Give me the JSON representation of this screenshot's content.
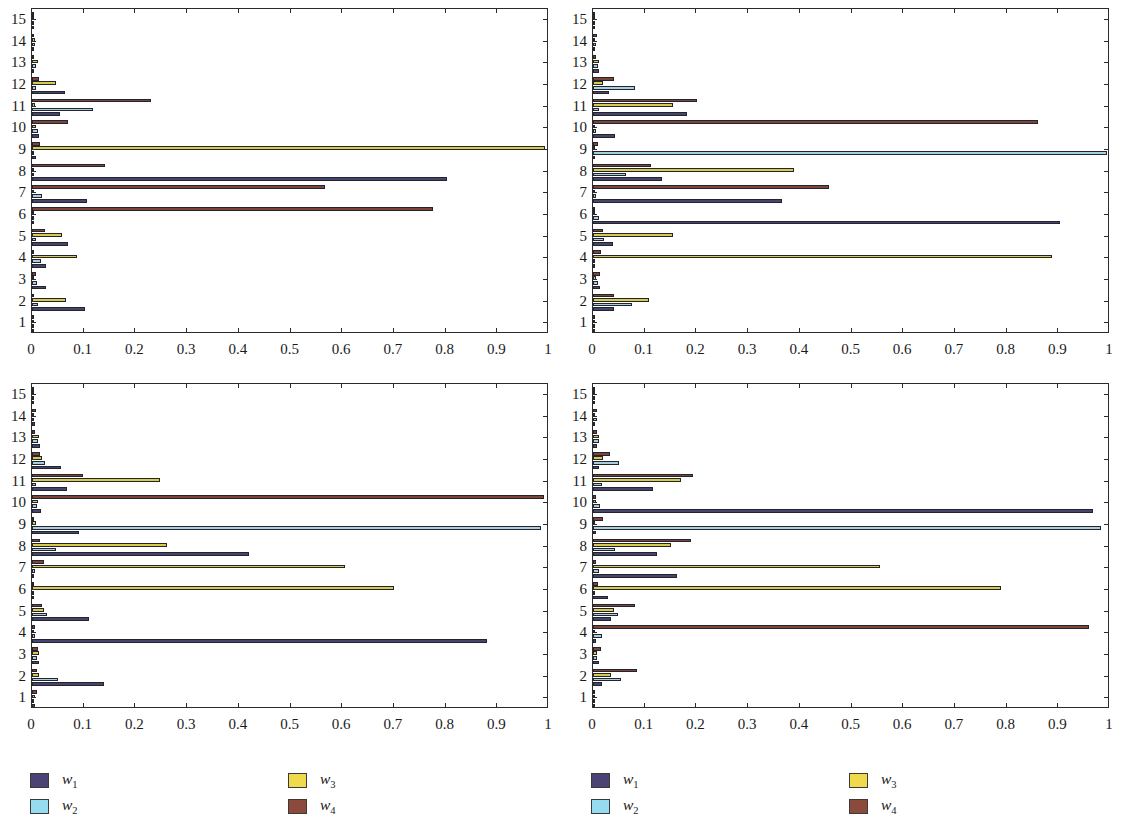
{
  "figure": {
    "width": 1122,
    "height": 825,
    "background": "#ffffff"
  },
  "series_colors": {
    "w1": "#45456e",
    "w2": "#a8cfe0",
    "w3": "#d8cb49",
    "w4": "#7d4438"
  },
  "legend_colors": {
    "w1": "#4a4373",
    "w2": "#96dcf0",
    "w3": "#f0d94a",
    "w4": "#8c4a3c"
  },
  "legends": [
    {
      "name": "legend-left",
      "items": [
        {
          "key": "w1",
          "label": "w",
          "sub": "1"
        },
        {
          "key": "w2",
          "label": "w",
          "sub": "2"
        },
        {
          "key": "w3",
          "label": "w",
          "sub": "3"
        },
        {
          "key": "w4",
          "label": "w",
          "sub": "4"
        }
      ]
    },
    {
      "name": "legend-right",
      "items": [
        {
          "key": "w1",
          "label": "w",
          "sub": "1"
        },
        {
          "key": "w2",
          "label": "w",
          "sub": "2"
        },
        {
          "key": "w3",
          "label": "w",
          "sub": "3"
        },
        {
          "key": "w4",
          "label": "w",
          "sub": "4"
        }
      ]
    }
  ],
  "axis": {
    "x_ticks": [
      "0",
      "0.1",
      "0.2",
      "0.3",
      "0.4",
      "0.5",
      "0.6",
      "0.7",
      "0.8",
      "0.9",
      "1"
    ],
    "x_tick_values": [
      0,
      0.1,
      0.2,
      0.3,
      0.4,
      0.5,
      0.6,
      0.7,
      0.8,
      0.9,
      1
    ],
    "xlim": [
      0,
      1
    ],
    "y_ticks": [
      "1",
      "2",
      "3",
      "4",
      "5",
      "6",
      "7",
      "8",
      "9",
      "10",
      "11",
      "12",
      "13",
      "14",
      "15"
    ],
    "grid": false
  },
  "chart_data": [
    {
      "type": "bar",
      "orientation": "horizontal",
      "title": "Normal gait",
      "xlabel": "",
      "ylabel": "",
      "xlim": [
        0,
        1
      ],
      "categories": [
        "1",
        "2",
        "3",
        "4",
        "5",
        "6",
        "7",
        "8",
        "9",
        "10",
        "11",
        "12",
        "13",
        "14",
        "15"
      ],
      "legend_position": "below-figure",
      "series": [
        {
          "name": "w1",
          "values": [
            0.004,
            0.103,
            0.027,
            0.028,
            0.07,
            0.003,
            0.106,
            0.803,
            0.008,
            0.013,
            0.055,
            0.064,
            0.003,
            0.004,
            0.002
          ]
        },
        {
          "name": "w2",
          "values": [
            0.003,
            0.011,
            0.009,
            0.018,
            0.007,
            0.002,
            0.019,
            0.003,
            0.003,
            0.012,
            0.118,
            0.008,
            0.008,
            0.006,
            0.002
          ]
        },
        {
          "name": "w3",
          "values": [
            0.002,
            0.066,
            0.003,
            0.088,
            0.058,
            0.002,
            0.004,
            0.004,
            0.993,
            0.008,
            0.005,
            0.046,
            0.012,
            0.005,
            0.001
          ]
        },
        {
          "name": "w4",
          "values": [
            0.002,
            0.004,
            0.008,
            0.004,
            0.026,
            0.775,
            0.566,
            0.142,
            0.016,
            0.07,
            0.231,
            0.013,
            0.004,
            0.004,
            0.002
          ]
        }
      ]
    },
    {
      "type": "bar",
      "orientation": "horizontal",
      "title": "Bouncy gait",
      "xlabel": "",
      "ylabel": "",
      "xlim": [
        0,
        1
      ],
      "categories": [
        "1",
        "2",
        "3",
        "4",
        "5",
        "6",
        "7",
        "8",
        "9",
        "10",
        "11",
        "12",
        "13",
        "14",
        "15"
      ],
      "legend_position": "below-figure",
      "series": [
        {
          "name": "w1",
          "values": [
            0.004,
            0.04,
            0.013,
            0.003,
            0.038,
            0.903,
            0.366,
            0.134,
            0.003,
            0.042,
            0.182,
            0.03,
            0.012,
            0.004,
            0.002
          ]
        },
        {
          "name": "w2",
          "values": [
            0.003,
            0.076,
            0.01,
            0.004,
            0.022,
            0.011,
            0.006,
            0.064,
            0.994,
            0.005,
            0.011,
            0.082,
            0.009,
            0.006,
            0.002
          ]
        },
        {
          "name": "w3",
          "values": [
            0.002,
            0.109,
            0.005,
            0.888,
            0.155,
            0.003,
            0.004,
            0.389,
            0.004,
            0.004,
            0.154,
            0.02,
            0.011,
            0.004,
            0.002
          ]
        },
        {
          "name": "w4",
          "values": [
            0.003,
            0.041,
            0.013,
            0.015,
            0.019,
            0.003,
            0.457,
            0.113,
            0.01,
            0.861,
            0.201,
            0.04,
            0.006,
            0.008,
            0.003
          ]
        }
      ]
    },
    {
      "type": "bar",
      "orientation": "horizontal",
      "title": "Medial thrust gait",
      "xlabel": "",
      "ylabel": "",
      "xlim": [
        0,
        1
      ],
      "categories": [
        "1",
        "2",
        "3",
        "4",
        "5",
        "6",
        "7",
        "8",
        "9",
        "10",
        "11",
        "12",
        "13",
        "14",
        "15"
      ],
      "legend_position": "below-figure",
      "series": [
        {
          "name": "w1",
          "values": [
            0.006,
            0.139,
            0.013,
            0.881,
            0.11,
            0.003,
            0.004,
            0.419,
            0.09,
            0.017,
            0.068,
            0.056,
            0.016,
            0.005,
            0.002
          ]
        },
        {
          "name": "w2",
          "values": [
            0.004,
            0.05,
            0.009,
            0.006,
            0.029,
            0.004,
            0.006,
            0.046,
            0.985,
            0.009,
            0.008,
            0.026,
            0.011,
            0.004,
            0.002
          ]
        },
        {
          "name": "w3",
          "values": [
            0.005,
            0.013,
            0.014,
            0.004,
            0.023,
            0.701,
            0.606,
            0.261,
            0.007,
            0.011,
            0.247,
            0.019,
            0.013,
            0.004,
            0.002
          ]
        },
        {
          "name": "w4",
          "values": [
            0.009,
            0.01,
            0.012,
            0.005,
            0.019,
            0.004,
            0.024,
            0.015,
            0.004,
            0.99,
            0.099,
            0.015,
            0.006,
            0.007,
            0.003
          ]
        }
      ]
    },
    {
      "type": "bar",
      "orientation": "horizontal",
      "title": "Mtp gait",
      "xlabel": "",
      "ylabel": "",
      "xlim": [
        0,
        1
      ],
      "categories": [
        "1",
        "2",
        "3",
        "4",
        "5",
        "6",
        "7",
        "8",
        "9",
        "10",
        "11",
        "12",
        "13",
        "14",
        "15"
      ],
      "legend_position": "below-figure",
      "series": [
        {
          "name": "w1",
          "values": [
            0.004,
            0.017,
            0.011,
            0.006,
            0.035,
            0.029,
            0.162,
            0.123,
            0.006,
            0.968,
            0.117,
            0.011,
            0.007,
            0.004,
            0.002
          ]
        },
        {
          "name": "w2",
          "values": [
            0.003,
            0.055,
            0.008,
            0.017,
            0.049,
            0.004,
            0.012,
            0.042,
            0.982,
            0.013,
            0.018,
            0.05,
            0.012,
            0.007,
            0.002
          ]
        },
        {
          "name": "w3",
          "values": [
            0.003,
            0.035,
            0.007,
            0.004,
            0.041,
            0.789,
            0.556,
            0.151,
            0.004,
            0.005,
            0.171,
            0.019,
            0.011,
            0.004,
            0.002
          ]
        },
        {
          "name": "w4",
          "values": [
            0.004,
            0.086,
            0.016,
            0.96,
            0.081,
            0.01,
            0.005,
            0.19,
            0.019,
            0.006,
            0.193,
            0.033,
            0.007,
            0.008,
            0.003
          ]
        }
      ]
    }
  ]
}
